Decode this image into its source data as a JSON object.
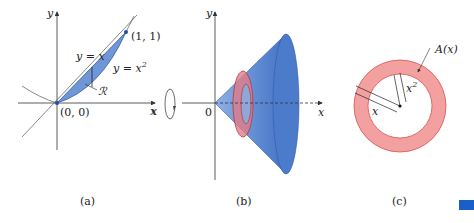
{
  "figure": {
    "panels": [
      {
        "id": "a",
        "caption": "(a)",
        "labels": {
          "y_axis": "y",
          "x_axis": "x",
          "point_top": "(1, 1)",
          "origin": "(0, 0)",
          "line_label": "y = x",
          "curve_label": "y = x",
          "curve_exp": "2",
          "region_label": "ℛ"
        }
      },
      {
        "id": "b",
        "caption": "(b)",
        "labels": {
          "y_axis": "y",
          "x_axis_left": "x",
          "x_axis_right": "x",
          "origin": "0"
        }
      },
      {
        "id": "c",
        "caption": "(c)",
        "labels": {
          "area_label": "A(x)",
          "outer_radius": "x",
          "inner_radius": "x",
          "inner_exp": "2"
        }
      }
    ],
    "colors": {
      "region_blue": "#6f97d8",
      "cone_blue": "#5b86d0",
      "washer_red": "#f2a0a0",
      "washer_edge": "#d9534f",
      "corner_tab": "#1a5fc9"
    }
  }
}
